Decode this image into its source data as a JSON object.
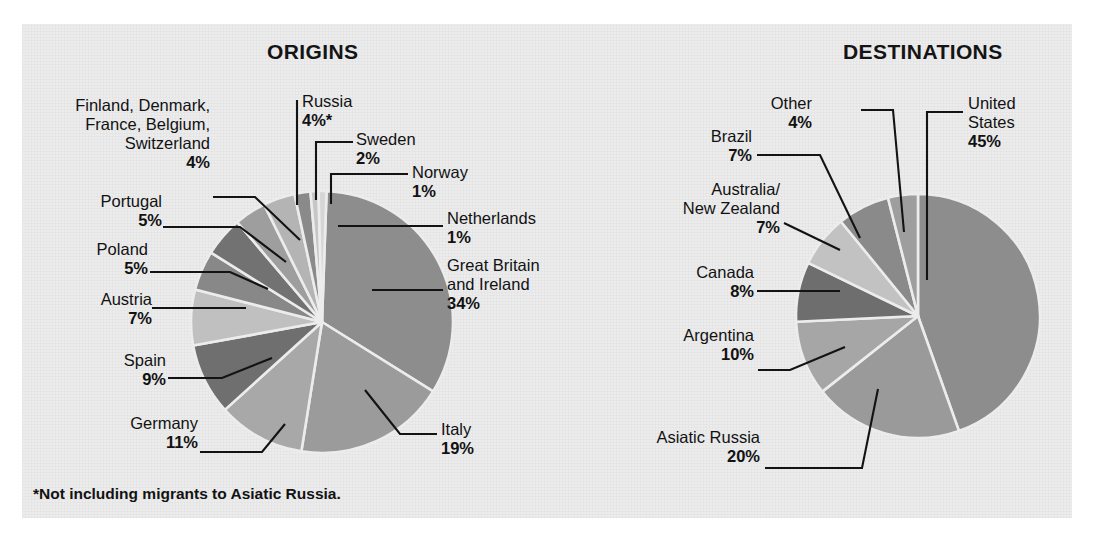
{
  "figure": {
    "background_color": "#ffffff",
    "panel_color": "#ececed",
    "text_color": "#121212",
    "footnote": "*Not including migrants to Asiatic Russia."
  },
  "chart_data": [
    {
      "type": "pie",
      "title": "ORIGINS",
      "xlabel": "",
      "ylabel": "",
      "legend_position": "none",
      "grid": false,
      "note": "*Not including migrants to Asiatic Russia.",
      "categories": [
        "Great Britain and Ireland",
        "Italy",
        "Germany",
        "Spain",
        "Austria",
        "Poland",
        "Portugal",
        "Finland, Denmark, France, Belgium, Switzerland",
        "Russia",
        "Sweden",
        "Norway",
        "Netherlands"
      ],
      "values": [
        34,
        19,
        11,
        9,
        7,
        5,
        5,
        4,
        4,
        2,
        1,
        1
      ],
      "labels": [
        {
          "name": "Great Britain\nand Ireland",
          "name_lines": [
            "Great Britain",
            "and Ireland"
          ],
          "pct": "34%",
          "value": 34,
          "color": "#8d8d8d"
        },
        {
          "name": "Italy",
          "name_lines": [
            "Italy"
          ],
          "pct": "19%",
          "value": 19,
          "color": "#9b9b9b"
        },
        {
          "name": "Germany",
          "name_lines": [
            "Germany"
          ],
          "pct": "11%",
          "value": 11,
          "color": "#a8a8a8"
        },
        {
          "name": "Spain",
          "name_lines": [
            "Spain"
          ],
          "pct": "9%",
          "value": 9,
          "color": "#6f6f6f"
        },
        {
          "name": "Austria",
          "name_lines": [
            "Austria"
          ],
          "pct": "7%",
          "value": 7,
          "color": "#c0c0c0"
        },
        {
          "name": "Poland",
          "name_lines": [
            "Poland"
          ],
          "pct": "5%",
          "value": 5,
          "color": "#888888"
        },
        {
          "name": "Portugal",
          "name_lines": [
            "Portugal"
          ],
          "pct": "5%",
          "value": 5,
          "color": "#727272"
        },
        {
          "name": "Finland, Denmark,\nFrance, Belgium,\nSwitzerland",
          "name_lines": [
            "Finland, Denmark,",
            "France, Belgium,",
            "Switzerland"
          ],
          "pct": "4%",
          "value": 4,
          "color": "#9e9e9e"
        },
        {
          "name": "Russia",
          "name_lines": [
            "Russia"
          ],
          "pct": "4%*",
          "value": 4,
          "color": "#b4b4b4"
        },
        {
          "name": "Sweden",
          "name_lines": [
            "Sweden"
          ],
          "pct": "2%",
          "value": 2,
          "color": "#8a8a8a"
        },
        {
          "name": "Norway",
          "name_lines": [
            "Norway"
          ],
          "pct": "1%",
          "value": 1,
          "color": "#c6c6c6"
        },
        {
          "name": "Netherlands",
          "name_lines": [
            "Netherlands"
          ],
          "pct": "1%",
          "value": 1,
          "color": "#d6d6d6"
        }
      ]
    },
    {
      "type": "pie",
      "title": "DESTINATIONS",
      "xlabel": "",
      "ylabel": "",
      "legend_position": "none",
      "grid": false,
      "categories": [
        "United States",
        "Asiatic Russia",
        "Argentina",
        "Canada",
        "Australia/New Zealand",
        "Brazil",
        "Other"
      ],
      "values": [
        45,
        20,
        10,
        8,
        7,
        7,
        4
      ],
      "labels": [
        {
          "name": "United\nStates",
          "name_lines": [
            "United",
            "States"
          ],
          "pct": "45%",
          "value": 45,
          "color": "#8d8d8d"
        },
        {
          "name": "Asiatic Russia",
          "name_lines": [
            "Asiatic Russia"
          ],
          "pct": "20%",
          "value": 20,
          "color": "#9a9a9a"
        },
        {
          "name": "Argentina",
          "name_lines": [
            "Argentina"
          ],
          "pct": "10%",
          "value": 10,
          "color": "#a6a6a6"
        },
        {
          "name": "Canada",
          "name_lines": [
            "Canada"
          ],
          "pct": "8%",
          "value": 8,
          "color": "#6e6e6e"
        },
        {
          "name": "Australia/\nNew Zealand",
          "name_lines": [
            "Australia/",
            "New Zealand"
          ],
          "pct": "7%",
          "value": 7,
          "color": "#c2c2c2"
        },
        {
          "name": "Brazil",
          "name_lines": [
            "Brazil"
          ],
          "pct": "7%",
          "value": 7,
          "color": "#8a8a8a"
        },
        {
          "name": "Other",
          "name_lines": [
            "Other"
          ],
          "pct": "4%",
          "value": 4,
          "color": "#9e9e9e"
        }
      ]
    }
  ]
}
